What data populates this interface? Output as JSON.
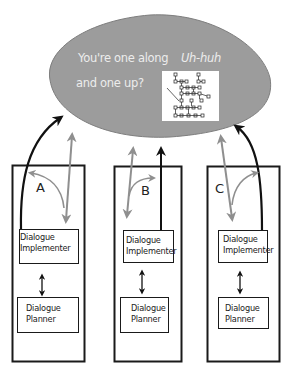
{
  "speech_bubble": {
    "utterance_line1": "You're one along",
    "utterance_line2": "and one up?",
    "response": "Uh-huh",
    "fill_color": "#9c9c9c",
    "text_color": "#ececec",
    "inset_graphic": "node-graph-thumbnail"
  },
  "agents": [
    {
      "label": "A",
      "implementer": {
        "line1": "Dialogue",
        "line2": "Implementer"
      },
      "planner": {
        "line1": "Dialogue",
        "line2": "Planner"
      }
    },
    {
      "label": "B",
      "implementer": {
        "line1": "Dialogue",
        "line2": "Implementer"
      },
      "planner": {
        "line1": "Dialogue",
        "line2": "Planner"
      }
    },
    {
      "label": "C",
      "implementer": {
        "line1": "Dialogue",
        "line2": "Implementer"
      },
      "planner": {
        "line1": "Dialogue",
        "line2": "Planner"
      }
    }
  ],
  "colors": {
    "black_arrow": "#111111",
    "gray_arrow": "#8f8f8f",
    "box_stroke": "#1a1a1a"
  }
}
